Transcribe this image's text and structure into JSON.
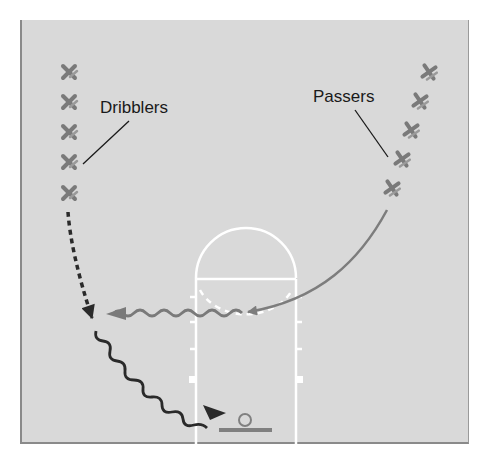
{
  "diagram": {
    "type": "basketball-drill",
    "labels": {
      "dribblers": "Dribblers",
      "passers": "Passers"
    },
    "colors": {
      "court": "#d9d9d9",
      "court_lines": "#ffffff",
      "player_marker": "#7a7a7a",
      "pass_arrow": "#808080",
      "dribble_path": "#2a2a2a",
      "cut_path": "#2a2a2a",
      "label_text": "#1a1a1a"
    },
    "players": {
      "dribblers": {
        "symbol": "X",
        "count": 5
      },
      "passers": {
        "symbol": "+",
        "count": 5
      }
    },
    "paths": [
      {
        "kind": "cut",
        "style": "dashed-arrow",
        "from": "dribbler line",
        "to": "left wing"
      },
      {
        "kind": "pass",
        "style": "solid-arrow",
        "from": "passer line",
        "to": "free-throw area"
      },
      {
        "kind": "dribble",
        "style": "wavy-arrow",
        "from": "free-throw area",
        "to": "left wing"
      },
      {
        "kind": "dribble",
        "style": "wavy-arrow",
        "from": "left wing",
        "to": "basket"
      }
    ]
  }
}
